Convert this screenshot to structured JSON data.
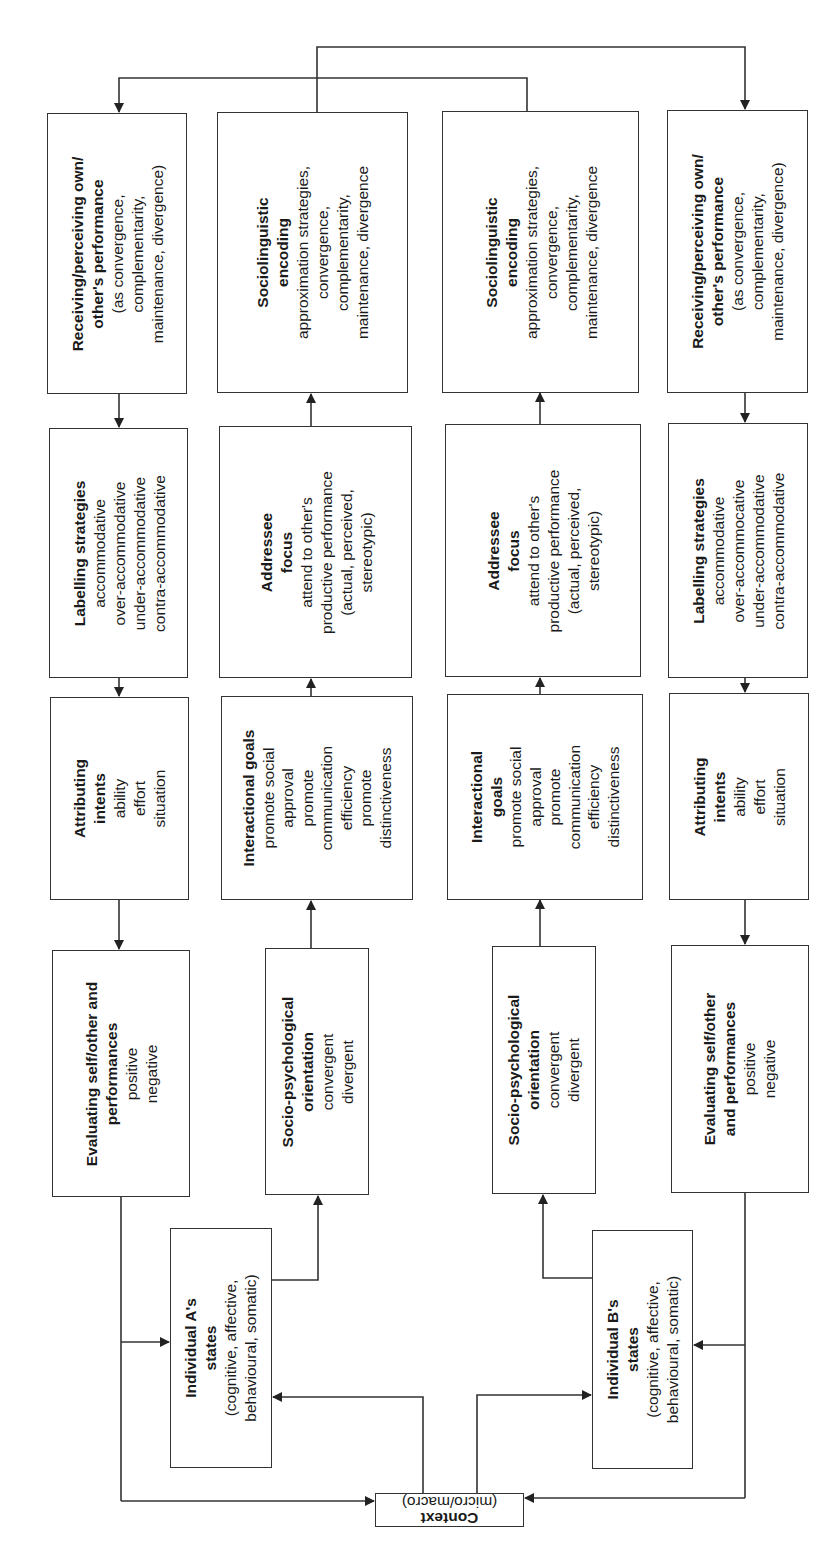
{
  "diagram": {
    "type": "flow diagram",
    "orientation": "rotated 90 degrees counter-clockwise",
    "colors": {
      "line": "#333333",
      "text": "#1a1a1a",
      "background": "#ffffff"
    },
    "boxes": {
      "a_receiving": {
        "title_lines": [
          "Receiving/perceiving own/",
          "other's performance"
        ],
        "lines": [
          "(as convergence,",
          "complementarity,",
          "maintenance, divergence)"
        ]
      },
      "a_sociolinguistic": {
        "title_lines": [
          "Sociolinguistic",
          "encoding"
        ],
        "lines": [
          "approximation strategies,",
          "convergence,",
          "complementarity,",
          "maintenance, divergence"
        ]
      },
      "b_sociolinguistic": {
        "title_lines": [
          "Sociolinguistic",
          "encoding"
        ],
        "lines": [
          "approximation strategies,",
          "convergence,",
          "complementarity,",
          "maintenance, divergence"
        ]
      },
      "b_receiving": {
        "title_lines": [
          "Receiving/perceiving own/",
          "other's performance"
        ],
        "lines": [
          "(as convergence,",
          "complementarity,",
          "maintenance, divergence)"
        ]
      },
      "a_labelling": {
        "title_lines": [
          "Labelling strategies"
        ],
        "lines": [
          "accommodative",
          "over-accommodative",
          "under-accommodative",
          "contra-accommodative"
        ]
      },
      "a_addressee": {
        "title_lines": [
          "Addressee",
          "focus"
        ],
        "lines": [
          "attend to other's",
          "productive performance",
          "(actual, perceived,",
          "stereotypic)"
        ]
      },
      "b_addressee": {
        "title_lines": [
          "Addressee",
          "focus"
        ],
        "lines": [
          "attend to other's",
          "productive performance",
          "(actual, perceived,",
          "stereotypic)"
        ]
      },
      "b_labelling": {
        "title_lines": [
          "Labelling strategies"
        ],
        "lines": [
          "accommodative",
          "over-accommocative",
          "under-accommodative",
          "contra-accommodative"
        ]
      },
      "a_attributing": {
        "title_lines": [
          "Attributing",
          "intents"
        ],
        "lines": [
          "ability",
          "effort",
          "situation"
        ]
      },
      "a_interactional": {
        "title_lines": [
          "Interactional goals"
        ],
        "lines": [
          "promote social",
          "approval",
          "promote",
          "communication",
          "efficiency",
          "promote",
          "distinctiveness"
        ]
      },
      "b_interactional": {
        "title_lines": [
          "Interactional",
          "goals"
        ],
        "lines": [
          "promote social",
          "approval",
          "promote",
          "communication",
          "efficiency",
          "distinctiveness"
        ]
      },
      "b_attributing": {
        "title_lines": [
          "Attributing",
          "intents"
        ],
        "lines": [
          "ability",
          "effort",
          "situation"
        ]
      },
      "a_evaluating": {
        "title_lines": [
          "Evaluating self/other and",
          "performances"
        ],
        "lines": [
          "positive",
          "negative"
        ]
      },
      "a_sociopsych": {
        "title_lines": [
          "Socio-psychological",
          "orientation"
        ],
        "lines": [
          "convergent",
          "divergent"
        ]
      },
      "b_sociopsych": {
        "title_lines": [
          "Socio-psychological",
          "orientation"
        ],
        "lines": [
          "convergent",
          "divergent"
        ]
      },
      "b_evaluating": {
        "title_lines": [
          "Evaluating self/other",
          "and performances"
        ],
        "lines": [
          "positive",
          "negative"
        ]
      },
      "a_states": {
        "title_lines": [
          "Individual A's",
          "states"
        ],
        "lines": [
          "(cognitive, affective,",
          "behavioural, somatic)"
        ]
      },
      "b_states": {
        "title_lines": [
          "Individual B's",
          "states"
        ],
        "lines": [
          "(cognitive, affective,",
          "behavioural, somatic)"
        ]
      },
      "context": {
        "title_lines": [
          "Context"
        ],
        "lines": [
          "(micro/macro)"
        ]
      }
    }
  }
}
